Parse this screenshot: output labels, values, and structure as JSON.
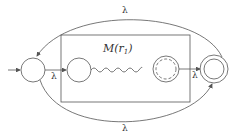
{
  "diagram": {
    "type": "nfa-kleene-star-construction",
    "box_label": "M(r1)",
    "box_label_main": "M(",
    "box_label_var": "r",
    "box_label_sub": "1",
    "box_label_close": ")",
    "edges": {
      "top": "λ",
      "bottom": "λ",
      "start_to_inner": "λ",
      "inner_to_final": "λ"
    },
    "colors": {
      "stroke": "#555555",
      "background": "#ffffff"
    }
  }
}
